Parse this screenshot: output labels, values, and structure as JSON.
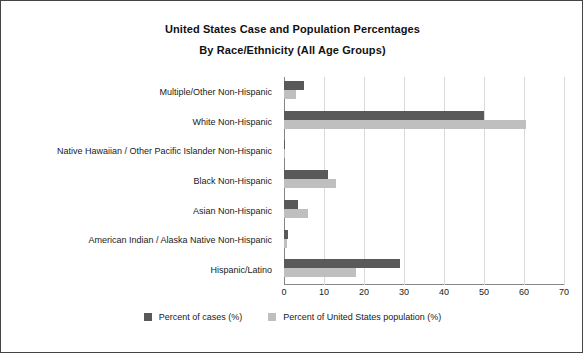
{
  "chart_data": {
    "type": "bar",
    "orientation": "horizontal",
    "title": "United States Case and Population Percentages",
    "subtitle": "By Race/Ethnicity (All Age Groups)",
    "xlabel": "",
    "ylabel": "",
    "xlim": [
      0,
      70
    ],
    "xticks": [
      0,
      10,
      20,
      30,
      40,
      50,
      60,
      70
    ],
    "grid": true,
    "legend_position": "bottom",
    "categories": [
      "Multiple/Other Non-Hispanic",
      "White Non-Hispanic",
      "Native Hawaiian / Other Pacific Islander Non-Hispanic",
      "Black Non-Hispanic",
      "Asian Non-Hispanic",
      "American Indian / Alaska Native Non-Hispanic",
      "Hispanic/Latino"
    ],
    "series": [
      {
        "name": "Percent of cases (%)",
        "color": "#595959",
        "values": [
          5.0,
          50.0,
          0.3,
          11.0,
          3.5,
          1.0,
          29.0
        ]
      },
      {
        "name": "Percent of United States population (%)",
        "color": "#bfbfbf",
        "values": [
          3.0,
          60.5,
          0.2,
          13.0,
          6.0,
          0.7,
          18.0
        ]
      }
    ]
  },
  "legend": {
    "items": [
      {
        "label": "Percent of cases (%)"
      },
      {
        "label": "Percent of United States population (%)"
      }
    ]
  }
}
